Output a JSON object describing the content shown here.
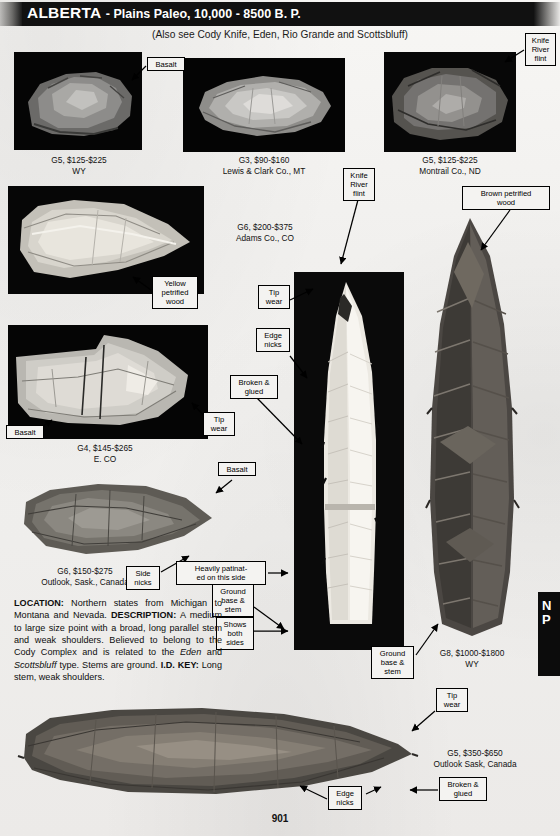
{
  "header": {
    "title": "ALBERTA",
    "subtitle": "- Plains Paleo, 10,000 - 8500 B. P.",
    "also_see": "(Also see Cody Knife, Eden, Rio Grande and Scottsbluff)"
  },
  "page_number": "901",
  "edge_tab": {
    "line1": "N",
    "line2": "P"
  },
  "specimens": [
    {
      "id": "s1",
      "grade_price": "G5, $125-$225",
      "provenance": "WY"
    },
    {
      "id": "s2",
      "grade_price": "G3, $90-$160",
      "provenance": "Lewis & Clark Co., MT"
    },
    {
      "id": "s3",
      "grade_price": "G5, $125-$225",
      "provenance": "Montrail Co., ND"
    },
    {
      "id": "s4",
      "grade_price": "G6, $200-$375",
      "provenance": "Adams Co., CO"
    },
    {
      "id": "s5",
      "grade_price": "G4, $145-$265",
      "provenance": "E. CO"
    },
    {
      "id": "s6",
      "grade_price": "G6, $150-$275",
      "provenance": "Outlook, Sask., Canada"
    },
    {
      "id": "s7",
      "grade_price": "G8, $1000-$1800",
      "provenance": "WY"
    },
    {
      "id": "s8",
      "grade_price": "G5, $350-$650",
      "provenance": "Outlook Sask, Canada"
    }
  ],
  "labels": {
    "basalt_top": "Basalt",
    "knife_river_flint_topright": "Knife\nRiver\nflint",
    "brown_petrified_wood": "Brown petrified\nwood",
    "knife_river_flint_center": "Knife\nRiver\nflint",
    "yellow_petrified_wood": "Yellow\npetrified\nwood",
    "tip_wear_center": "Tip\nwear",
    "edge_nicks_center": "Edge\nnicks",
    "broken_glued_center": "Broken &\nglued",
    "basalt_mid_left": "Basalt",
    "tip_wear_left": "Tip\nwear",
    "basalt_mid": "Basalt",
    "side_nicks": "Side\nnicks",
    "heavily_patinated": "Heavily patinat-\ned on this side",
    "ground_base_stem_left": "Ground\nbase &\nstem",
    "shows_both_sides": "Shows\nboth\nsides",
    "ground_base_stem_right": "Ground\nbase &\nstem",
    "tip_wear_bottom": "Tip\nwear",
    "edge_nicks_bottom": "Edge\nnicks",
    "broken_glued_bottom": "Broken &\nglued"
  },
  "description": {
    "location_key": "LOCATION:",
    "location_text": " Northern states from Michigan to Montana and Nevada.",
    "description_key": "DESCRIPTION:",
    "description_text_a": " A medium to large size point with a broad, long parallel stem and weak shoulders. Believed to belong to the Cody Complex and is related to the ",
    "description_italic_a": "Eden",
    "description_text_b": " and ",
    "description_italic_b": "Scottsbluff",
    "description_text_c": " type. Stems are ground.",
    "idkey_key": "I.D. KEY:",
    "idkey_text": " Long stem, weak shoulders."
  }
}
